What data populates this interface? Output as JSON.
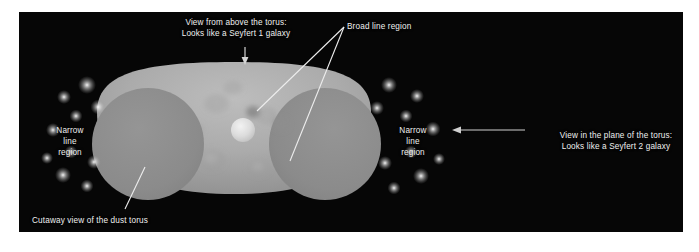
{
  "figure": {
    "kind": "astronomy-diagram",
    "panel": {
      "background_color": "#060606",
      "border_color": "#ffffff"
    }
  },
  "labels": {
    "view_above": "View from above the torus:\nLooks like a Seyfert 1 galaxy",
    "broad_line_region": "Broad line region",
    "narrow_line_region_left": "Narrow\nline\nregion",
    "narrow_line_region_right": "Narrow\nline\nregion",
    "view_plane": "View in the plane of the torus:\nLooks like a Seyfert 2 galaxy",
    "cutaway": "Cutaway view of the dust torus"
  },
  "colors": {
    "background": "#060606",
    "page": "#ffffff",
    "text": "#f0f0f0",
    "torus_envelope_light": "#b4b4b4",
    "torus_envelope_mid": "#a2a2a2",
    "torus_cutaway_face": "#8c8c8c",
    "central_source": "#e8e8e8",
    "cloud_blob": "#9a9a9a",
    "leader_line": "#e6e6e6",
    "arrow": "#d8d8d8",
    "star_glow": "#ffffff"
  },
  "graphic": {
    "torus": {
      "envelope_center_x": 215,
      "envelope_center_y": 119,
      "envelope_width": 330,
      "envelope_height": 120,
      "cutaway_left": {
        "cx": 129,
        "cy": 132,
        "r": 56
      },
      "cutaway_right": {
        "cx": 306,
        "cy": 132,
        "r": 56
      },
      "central_source": {
        "cx": 224,
        "cy": 118,
        "r": 12
      }
    },
    "arrows": [
      {
        "name": "view-above-arrow",
        "x1": 226,
        "y1": 35,
        "x2": 226,
        "y2": 52,
        "direction": "down"
      },
      {
        "name": "view-plane-arrow",
        "x1": 506,
        "y1": 118,
        "x2": 433,
        "y2": 118,
        "direction": "left"
      }
    ],
    "leader_lines": [
      {
        "name": "broad-line-leader-1",
        "x1": 325,
        "y1": 15,
        "x2": 238,
        "y2": 98
      },
      {
        "name": "broad-line-leader-2",
        "x1": 325,
        "y1": 15,
        "x2": 272,
        "y2": 148
      },
      {
        "name": "cutaway-leader",
        "x1": 126,
        "y1": 155,
        "x2": 106,
        "y2": 196
      }
    ],
    "narrow_line_clouds_left": [
      {
        "cx": 68,
        "cy": 73,
        "r": 4.5
      },
      {
        "cx": 45,
        "cy": 85,
        "r": 3.2
      },
      {
        "cx": 79,
        "cy": 95,
        "r": 3.6
      },
      {
        "cx": 57,
        "cy": 104,
        "r": 3.0
      },
      {
        "cx": 34,
        "cy": 118,
        "r": 3.4
      },
      {
        "cx": 52,
        "cy": 140,
        "r": 3.0
      },
      {
        "cx": 75,
        "cy": 150,
        "r": 3.4
      },
      {
        "cx": 44,
        "cy": 163,
        "r": 3.8
      },
      {
        "cx": 68,
        "cy": 174,
        "r": 3.0
      },
      {
        "cx": 28,
        "cy": 146,
        "r": 2.6
      }
    ],
    "narrow_line_clouds_right": [
      {
        "cx": 370,
        "cy": 73,
        "r": 4.0
      },
      {
        "cx": 398,
        "cy": 84,
        "r": 3.4
      },
      {
        "cx": 358,
        "cy": 96,
        "r": 3.2
      },
      {
        "cx": 387,
        "cy": 104,
        "r": 3.0
      },
      {
        "cx": 414,
        "cy": 117,
        "r": 3.6
      },
      {
        "cx": 392,
        "cy": 140,
        "r": 3.2
      },
      {
        "cx": 366,
        "cy": 151,
        "r": 3.4
      },
      {
        "cx": 402,
        "cy": 164,
        "r": 3.8
      },
      {
        "cx": 375,
        "cy": 176,
        "r": 3.0
      },
      {
        "cx": 420,
        "cy": 147,
        "r": 2.6
      }
    ]
  }
}
